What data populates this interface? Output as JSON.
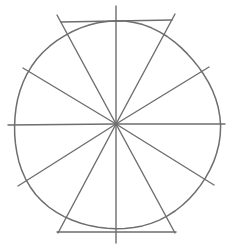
{
  "diagram": {
    "title": "",
    "colors": {
      "background": "#ffffff",
      "stroke": "#6e6e6e"
    },
    "canvas": {
      "width": 232,
      "height": 250
    },
    "center": {
      "x": 116,
      "y": 124
    },
    "circle": {
      "cx": 116,
      "cy": 126,
      "rx": 103,
      "ry": 104
    },
    "spokes": [
      {
        "name": "spoke-top-vertical",
        "x1": 116,
        "y1": 124,
        "x2": 116,
        "y2": 6
      },
      {
        "name": "spoke-top-left",
        "x1": 116,
        "y1": 124,
        "x2": 57,
        "y2": 15
      },
      {
        "name": "spoke-top-right",
        "x1": 116,
        "y1": 124,
        "x2": 175,
        "y2": 14
      },
      {
        "name": "spoke-upper-left",
        "x1": 116,
        "y1": 124,
        "x2": 23,
        "y2": 68
      },
      {
        "name": "spoke-upper-right",
        "x1": 116,
        "y1": 124,
        "x2": 209,
        "y2": 67
      },
      {
        "name": "spoke-left-horizontal",
        "x1": 116,
        "y1": 124,
        "x2": 8,
        "y2": 125
      },
      {
        "name": "spoke-right-horizontal",
        "x1": 116,
        "y1": 124,
        "x2": 225,
        "y2": 124
      },
      {
        "name": "spoke-lower-left",
        "x1": 116,
        "y1": 124,
        "x2": 18,
        "y2": 186
      },
      {
        "name": "spoke-lower-right",
        "x1": 116,
        "y1": 124,
        "x2": 214,
        "y2": 185
      },
      {
        "name": "spoke-bottom-left",
        "x1": 116,
        "y1": 124,
        "x2": 58,
        "y2": 233
      },
      {
        "name": "spoke-bottom-right",
        "x1": 116,
        "y1": 124,
        "x2": 175,
        "y2": 233
      },
      {
        "name": "spoke-bottom-vertical",
        "x1": 116,
        "y1": 124,
        "x2": 116,
        "y2": 243
      }
    ],
    "tangent_lines": [
      {
        "name": "top-tangent-line",
        "x1": 61,
        "y1": 22,
        "x2": 172,
        "y2": 20
      },
      {
        "name": "bottom-tangent-line",
        "x1": 57,
        "y1": 232,
        "x2": 176,
        "y2": 232
      }
    ]
  }
}
